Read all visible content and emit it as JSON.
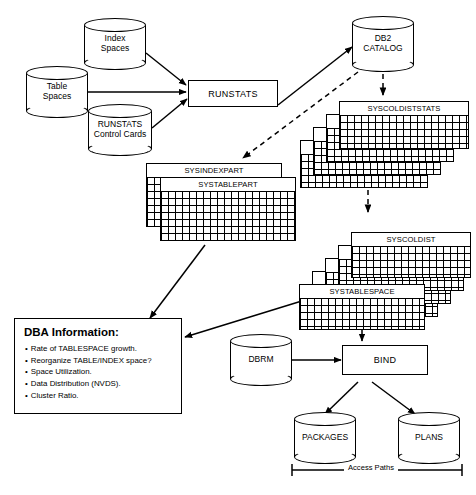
{
  "diagram": {
    "sources": [
      {
        "name": "index-spaces",
        "label": "Index\nSpaces"
      },
      {
        "name": "table-spaces",
        "label": "Table\nSpaces"
      },
      {
        "name": "runstats-cards",
        "label": "RUNSTATS\nControl Cards"
      }
    ],
    "processes": [
      {
        "name": "runstats",
        "label": "RUNSTATS"
      },
      {
        "name": "bind",
        "label": "BIND"
      }
    ],
    "catalog": {
      "name": "db2-catalog",
      "label": "DB2\nCATALOG"
    },
    "dbrm": {
      "name": "dbrm",
      "label": "DBRM"
    },
    "outputs": [
      {
        "name": "packages",
        "label": "PACKAGES"
      },
      {
        "name": "plans",
        "label": "PLANS"
      }
    ],
    "stats_tables": [
      "SYSCOLDISTSTATS",
      "SYSINDEXSTATS",
      "SYSCOLSTSTATS",
      "SYSTABSTATS"
    ],
    "part_tables": [
      "SYSINDEXPART",
      "SYSTABLEPART"
    ],
    "catalog_tables": [
      "SYSCOLDIST",
      "SYSINDEXES",
      "SYSCOLUMNS",
      "SYSTABLES",
      "SYSTABLESPACE"
    ],
    "dba_info": {
      "title": "DBA Information:",
      "items": [
        "Rate of TABLESPACE growth.",
        "Reorganize TABLE/INDEX space?",
        "Space Utilization.",
        "Data Distribution (NVDS).",
        "Cluster Ratio."
      ]
    },
    "access_paths_label": "Access Paths",
    "colors": {
      "line": "#000000",
      "shadow": "#111111",
      "background": "#ffffff"
    }
  }
}
